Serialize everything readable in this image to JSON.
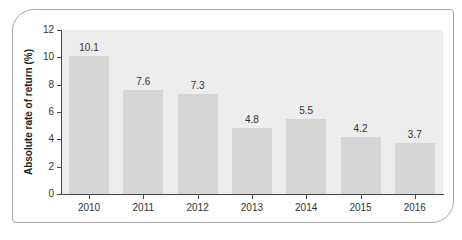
{
  "chart_data": {
    "type": "bar",
    "title": "",
    "xlabel": "",
    "ylabel": "Absolute rate of return (%)",
    "categories": [
      "2010",
      "2011",
      "2012",
      "2013",
      "2014",
      "2015",
      "2016"
    ],
    "values": [
      10.1,
      7.6,
      7.3,
      4.8,
      5.5,
      4.2,
      3.7
    ],
    "value_labels": [
      "10.1",
      "7.6",
      "7.3",
      "4.8",
      "5.5",
      "4.2",
      "3.7"
    ],
    "ylim": [
      0,
      12
    ],
    "yticks": [
      "0",
      "2",
      "4",
      "6",
      "8",
      "10",
      "12"
    ],
    "grid": false,
    "legend": null,
    "colors": {
      "bar": "#d5d5d5",
      "plot_background": "#ededed",
      "axis": "#444444"
    }
  }
}
